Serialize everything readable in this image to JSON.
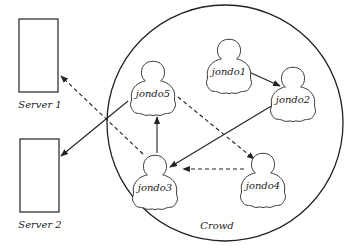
{
  "diagram": {
    "crowd": {
      "label": "Crowd",
      "cx": 225,
      "cy": 123,
      "r": 118
    },
    "servers": [
      {
        "id": "server1",
        "label": "Server 1",
        "x": 19,
        "y": 19,
        "w": 39,
        "h": 73
      },
      {
        "id": "server2",
        "label": "Server 2",
        "x": 20,
        "y": 139,
        "w": 39,
        "h": 73
      }
    ],
    "jondos": [
      {
        "id": "jondo1",
        "label": "jondo1",
        "cx": 229,
        "cy": 60
      },
      {
        "id": "jondo2",
        "label": "jondo2",
        "cx": 293,
        "cy": 89
      },
      {
        "id": "jondo3",
        "label": "jondo3",
        "cx": 155,
        "cy": 177
      },
      {
        "id": "jondo4",
        "label": "jondo4",
        "cx": 263,
        "cy": 175
      },
      {
        "id": "jondo5",
        "label": "jondo5",
        "cx": 153,
        "cy": 83
      }
    ],
    "edges": [
      {
        "from": "jondo1",
        "to": "jondo2",
        "style": "solid"
      },
      {
        "from": "jondo2",
        "to": "jondo3",
        "style": "solid"
      },
      {
        "from": "jondo3",
        "to": "jondo5",
        "style": "solid"
      },
      {
        "from": "jondo5",
        "to": "server2",
        "style": "solid"
      },
      {
        "from": "jondo5",
        "to": "jondo4",
        "style": "dashed"
      },
      {
        "from": "jondo4",
        "to": "jondo3",
        "style": "dashed"
      },
      {
        "from": "jondo3",
        "to": "server1",
        "style": "dashed"
      }
    ]
  }
}
